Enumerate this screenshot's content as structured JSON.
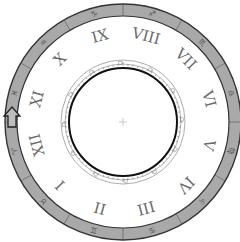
{
  "dial": {
    "center": [
      123,
      122
    ],
    "outer_band": {
      "outer_radius": 118,
      "inner_radius": 106,
      "fill": "#a9a9a9",
      "stroke": "#333333",
      "segments": 12
    },
    "numeral_radius": 89,
    "numerals": [
      "XII",
      "I",
      "II",
      "III",
      "IV",
      "V",
      "VI",
      "VII",
      "VIII",
      "IX",
      "X",
      "XI"
    ],
    "numeral_start_angle_deg": 195,
    "numeral_direction": "counter-clockwise",
    "numeral_color": "#6b6b6b",
    "glyph_icons": [
      "zodiac-glyph-1",
      "zodiac-glyph-2",
      "zodiac-glyph-3",
      "zodiac-glyph-4",
      "zodiac-glyph-5",
      "zodiac-glyph-6",
      "zodiac-glyph-7",
      "zodiac-glyph-8",
      "zodiac-glyph-9",
      "zodiac-glyph-10",
      "zodiac-glyph-11",
      "zodiac-glyph-12"
    ],
    "glyph_chars": [
      "♈",
      "♉",
      "♊",
      "♋",
      "♌",
      "♍",
      "♎",
      "♏",
      "♐",
      "♑",
      "♒",
      "♓"
    ],
    "inner_ring": {
      "outer_radius": 62,
      "inner_radius": 56,
      "core_radius": 54,
      "tick_count": 72
    },
    "pointer": {
      "icon": "up-arrow-icon",
      "position": [
        12,
        117
      ],
      "fill": "#bdbdbd"
    },
    "center_mark": {
      "icon": "crosshair-icon",
      "color": "#bbbbbb"
    }
  }
}
